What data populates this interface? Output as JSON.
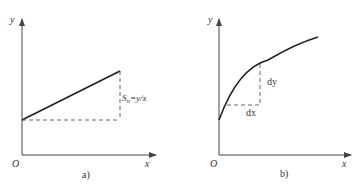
{
  "panel_a": {
    "y_axis_label": "y",
    "x_axis_label": "x",
    "origin_label": "O",
    "annotation_S": "S",
    "annotation_sub": "n",
    "annotation_rest": "=y/x",
    "caption": "a)"
  },
  "panel_b": {
    "y_axis_label": "y",
    "x_axis_label": "x",
    "origin_label": "O",
    "dy_label": "dy",
    "dx_label": "dx",
    "caption": "b)"
  },
  "colors": {
    "line": "#222222",
    "dash": "#555555",
    "axis": "#444444"
  }
}
